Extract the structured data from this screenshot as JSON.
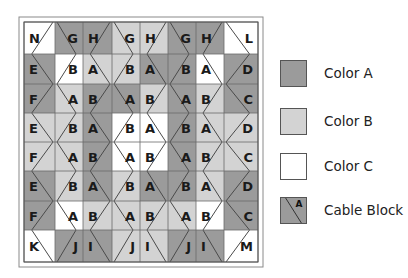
{
  "colors": {
    "A": "#9b9b9b",
    "B": "#d3d3d3",
    "C": "#ffffff",
    "line": "#4a4a4a",
    "frame": "#8a8a8a"
  },
  "legend": {
    "items": [
      {
        "key": "A",
        "label": "Color A",
        "top": 60
      },
      {
        "key": "B",
        "label": "Color B",
        "top": 108
      },
      {
        "key": "C",
        "label": "Color C",
        "top": 153
      },
      {
        "key": "cable",
        "label": "Cable Block",
        "top": 197,
        "glyph": "A"
      }
    ]
  },
  "quilt": {
    "outer_frame": [
      19,
      17,
      263,
      267
    ],
    "cols": [
      24,
      55,
      83,
      112,
      140,
      168,
      196,
      224,
      258
    ],
    "rows": [
      22,
      54,
      84,
      113,
      142,
      171,
      201,
      230,
      262
    ],
    "cells": [
      {
        "r": 0,
        "c": 0,
        "label": "N",
        "bg": "C",
        "fg": "C",
        "zig": "diagR",
        "lx": "left"
      },
      {
        "r": 0,
        "c": 1,
        "label": "G",
        "bg": "A",
        "fg": "A",
        "zig": "diagL",
        "lx": "right"
      },
      {
        "r": 0,
        "c": 2,
        "label": "H",
        "bg": "A",
        "fg": "A",
        "zig": "diagR",
        "lx": "left"
      },
      {
        "r": 0,
        "c": 3,
        "label": "G",
        "bg": "B",
        "fg": "B",
        "zig": "diagL",
        "lx": "right"
      },
      {
        "r": 0,
        "c": 4,
        "label": "H",
        "bg": "B",
        "fg": "B",
        "zig": "diagR",
        "lx": "left"
      },
      {
        "r": 0,
        "c": 5,
        "label": "G",
        "bg": "A",
        "fg": "A",
        "zig": "diagL",
        "lx": "right"
      },
      {
        "r": 0,
        "c": 6,
        "label": "H",
        "bg": "A",
        "fg": "A",
        "zig": "diagR",
        "lx": "left"
      },
      {
        "r": 0,
        "c": 7,
        "label": "L",
        "bg": "C",
        "fg": "C",
        "zig": "diagL",
        "lx": "right"
      },
      {
        "r": 1,
        "c": 0,
        "label": "E",
        "bg": "A",
        "fg": "A",
        "zig": "right",
        "lx": "left"
      },
      {
        "r": 1,
        "c": 1,
        "label": "B",
        "bg": "C",
        "fg": "C",
        "zig": "left",
        "lx": "right"
      },
      {
        "r": 1,
        "c": 2,
        "label": "A",
        "bg": "B",
        "fg": "B",
        "zig": "right",
        "lx": "left"
      },
      {
        "r": 1,
        "c": 3,
        "label": "B",
        "bg": "B",
        "fg": "B",
        "zig": "left",
        "lx": "right"
      },
      {
        "r": 1,
        "c": 4,
        "label": "A",
        "bg": "A",
        "fg": "A",
        "zig": "right",
        "lx": "left"
      },
      {
        "r": 1,
        "c": 5,
        "label": "B",
        "bg": "A",
        "fg": "A",
        "zig": "left",
        "lx": "right"
      },
      {
        "r": 1,
        "c": 6,
        "label": "A",
        "bg": "C",
        "fg": "C",
        "zig": "right",
        "lx": "left"
      },
      {
        "r": 1,
        "c": 7,
        "label": "D",
        "bg": "A",
        "fg": "A",
        "zig": "left",
        "lx": "right"
      },
      {
        "r": 2,
        "c": 0,
        "label": "F",
        "bg": "A",
        "fg": "A",
        "zig": "right2",
        "lx": "left"
      },
      {
        "r": 2,
        "c": 1,
        "label": "A",
        "bg": "B",
        "fg": "B",
        "zig": "left2",
        "lx": "right"
      },
      {
        "r": 2,
        "c": 2,
        "label": "B",
        "bg": "A",
        "fg": "A",
        "zig": "right2",
        "lx": "left"
      },
      {
        "r": 2,
        "c": 3,
        "label": "A",
        "bg": "A",
        "fg": "A",
        "zig": "left2",
        "lx": "right"
      },
      {
        "r": 2,
        "c": 4,
        "label": "B",
        "bg": "B",
        "fg": "B",
        "zig": "right2",
        "lx": "left"
      },
      {
        "r": 2,
        "c": 5,
        "label": "A",
        "bg": "A",
        "fg": "A",
        "zig": "left2",
        "lx": "right"
      },
      {
        "r": 2,
        "c": 6,
        "label": "B",
        "bg": "B",
        "fg": "B",
        "zig": "right2",
        "lx": "left"
      },
      {
        "r": 2,
        "c": 7,
        "label": "C",
        "bg": "A",
        "fg": "A",
        "zig": "left2",
        "lx": "right"
      },
      {
        "r": 3,
        "c": 0,
        "label": "E",
        "bg": "B",
        "fg": "B",
        "zig": "right",
        "lx": "left"
      },
      {
        "r": 3,
        "c": 1,
        "label": "B",
        "bg": "B",
        "fg": "B",
        "zig": "left",
        "lx": "right"
      },
      {
        "r": 3,
        "c": 2,
        "label": "A",
        "bg": "A",
        "fg": "A",
        "zig": "right",
        "lx": "left"
      },
      {
        "r": 3,
        "c": 3,
        "label": "B",
        "bg": "C",
        "fg": "C",
        "zig": "left",
        "lx": "right"
      },
      {
        "r": 3,
        "c": 4,
        "label": "A",
        "bg": "C",
        "fg": "C",
        "zig": "right",
        "lx": "left"
      },
      {
        "r": 3,
        "c": 5,
        "label": "B",
        "bg": "A",
        "fg": "A",
        "zig": "left",
        "lx": "right"
      },
      {
        "r": 3,
        "c": 6,
        "label": "A",
        "bg": "B",
        "fg": "B",
        "zig": "right",
        "lx": "left"
      },
      {
        "r": 3,
        "c": 7,
        "label": "D",
        "bg": "B",
        "fg": "B",
        "zig": "left",
        "lx": "right"
      },
      {
        "r": 4,
        "c": 0,
        "label": "F",
        "bg": "B",
        "fg": "B",
        "zig": "right2",
        "lx": "left"
      },
      {
        "r": 4,
        "c": 1,
        "label": "A",
        "bg": "B",
        "fg": "B",
        "zig": "left2",
        "lx": "right"
      },
      {
        "r": 4,
        "c": 2,
        "label": "B",
        "bg": "A",
        "fg": "A",
        "zig": "right2",
        "lx": "left"
      },
      {
        "r": 4,
        "c": 3,
        "label": "A",
        "bg": "C",
        "fg": "C",
        "zig": "left2",
        "lx": "right"
      },
      {
        "r": 4,
        "c": 4,
        "label": "B",
        "bg": "C",
        "fg": "C",
        "zig": "right2",
        "lx": "left"
      },
      {
        "r": 4,
        "c": 5,
        "label": "A",
        "bg": "A",
        "fg": "A",
        "zig": "left2",
        "lx": "right"
      },
      {
        "r": 4,
        "c": 6,
        "label": "B",
        "bg": "B",
        "fg": "B",
        "zig": "right2",
        "lx": "left"
      },
      {
        "r": 4,
        "c": 7,
        "label": "C",
        "bg": "B",
        "fg": "B",
        "zig": "left2",
        "lx": "right"
      },
      {
        "r": 5,
        "c": 0,
        "label": "E",
        "bg": "A",
        "fg": "A",
        "zig": "right",
        "lx": "left"
      },
      {
        "r": 5,
        "c": 1,
        "label": "B",
        "bg": "B",
        "fg": "B",
        "zig": "left",
        "lx": "right"
      },
      {
        "r": 5,
        "c": 2,
        "label": "A",
        "bg": "A",
        "fg": "A",
        "zig": "right",
        "lx": "left"
      },
      {
        "r": 5,
        "c": 3,
        "label": "B",
        "bg": "B",
        "fg": "B",
        "zig": "left",
        "lx": "right"
      },
      {
        "r": 5,
        "c": 4,
        "label": "A",
        "bg": "A",
        "fg": "A",
        "zig": "right",
        "lx": "left"
      },
      {
        "r": 5,
        "c": 5,
        "label": "B",
        "bg": "A",
        "fg": "A",
        "zig": "left",
        "lx": "right"
      },
      {
        "r": 5,
        "c": 6,
        "label": "A",
        "bg": "B",
        "fg": "B",
        "zig": "right",
        "lx": "left"
      },
      {
        "r": 5,
        "c": 7,
        "label": "D",
        "bg": "A",
        "fg": "A",
        "zig": "left",
        "lx": "right"
      },
      {
        "r": 6,
        "c": 0,
        "label": "F",
        "bg": "A",
        "fg": "A",
        "zig": "right2",
        "lx": "left"
      },
      {
        "r": 6,
        "c": 1,
        "label": "A",
        "bg": "C",
        "fg": "C",
        "zig": "left2",
        "lx": "right"
      },
      {
        "r": 6,
        "c": 2,
        "label": "B",
        "bg": "B",
        "fg": "B",
        "zig": "right2",
        "lx": "left"
      },
      {
        "r": 6,
        "c": 3,
        "label": "A",
        "bg": "B",
        "fg": "B",
        "zig": "left2",
        "lx": "right"
      },
      {
        "r": 6,
        "c": 4,
        "label": "B",
        "bg": "B",
        "fg": "B",
        "zig": "right2",
        "lx": "left"
      },
      {
        "r": 6,
        "c": 5,
        "label": "A",
        "bg": "B",
        "fg": "B",
        "zig": "left2",
        "lx": "right"
      },
      {
        "r": 6,
        "c": 6,
        "label": "B",
        "bg": "C",
        "fg": "C",
        "zig": "right2",
        "lx": "left"
      },
      {
        "r": 6,
        "c": 7,
        "label": "C",
        "bg": "A",
        "fg": "A",
        "zig": "left2",
        "lx": "right"
      },
      {
        "r": 7,
        "c": 0,
        "label": "K",
        "bg": "C",
        "fg": "C",
        "zig": "diagR2",
        "lx": "left"
      },
      {
        "r": 7,
        "c": 1,
        "label": "J",
        "bg": "A",
        "fg": "A",
        "zig": "diagL2",
        "lx": "right"
      },
      {
        "r": 7,
        "c": 2,
        "label": "I",
        "bg": "A",
        "fg": "A",
        "zig": "diagR2",
        "lx": "left"
      },
      {
        "r": 7,
        "c": 3,
        "label": "J",
        "bg": "B",
        "fg": "B",
        "zig": "diagL2",
        "lx": "right"
      },
      {
        "r": 7,
        "c": 4,
        "label": "I",
        "bg": "B",
        "fg": "B",
        "zig": "diagR2",
        "lx": "left"
      },
      {
        "r": 7,
        "c": 5,
        "label": "J",
        "bg": "A",
        "fg": "A",
        "zig": "diagL2",
        "lx": "right"
      },
      {
        "r": 7,
        "c": 6,
        "label": "I",
        "bg": "A",
        "fg": "A",
        "zig": "diagR2",
        "lx": "left"
      },
      {
        "r": 7,
        "c": 7,
        "label": "M",
        "bg": "C",
        "fg": "C",
        "zig": "diagL2",
        "lx": "right"
      }
    ]
  }
}
